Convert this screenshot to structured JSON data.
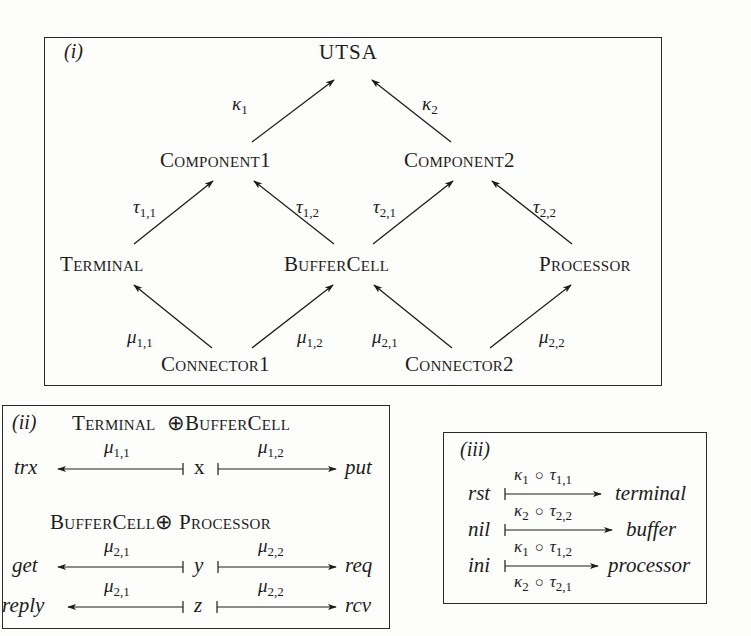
{
  "diagram_i": {
    "tag": "(i)",
    "nodes": {
      "root": "UTSA",
      "component1": "Component1",
      "component2": "Component2",
      "terminal": "Terminal",
      "buffercell": "BufferCell",
      "processor": "Processor",
      "connector1": "Connector1",
      "connector2": "Connector2"
    },
    "edges": {
      "kappa1": {
        "sym": "κ",
        "sub": "1",
        "from": "Component1",
        "to": "UTSA"
      },
      "kappa2": {
        "sym": "κ",
        "sub": "2",
        "from": "Component2",
        "to": "UTSA"
      },
      "tau11": {
        "sym": "τ",
        "sub": "1,1",
        "from": "Terminal",
        "to": "Component1"
      },
      "tau12": {
        "sym": "τ",
        "sub": "1,2",
        "from": "BufferCell",
        "to": "Component1"
      },
      "tau21": {
        "sym": "τ",
        "sub": "2,1",
        "from": "BufferCell",
        "to": "Component2"
      },
      "tau22": {
        "sym": "τ",
        "sub": "2,2",
        "from": "Processor",
        "to": "Component2"
      },
      "mu11": {
        "sym": "μ",
        "sub": "1,1",
        "from": "Connector1",
        "to": "Terminal"
      },
      "mu12": {
        "sym": "μ",
        "sub": "1,2",
        "from": "Connector1",
        "to": "BufferCell"
      },
      "mu21": {
        "sym": "μ",
        "sub": "2,1",
        "from": "Connector2",
        "to": "BufferCell"
      },
      "mu22": {
        "sym": "μ",
        "sub": "2,2",
        "from": "Connector2",
        "to": "Processor"
      }
    }
  },
  "diagram_ii": {
    "tag": "(ii)",
    "header1": {
      "left": "Terminal",
      "op": "⊕",
      "right": "BufferCell"
    },
    "header2": {
      "left": "BufferCell",
      "op": "⊕",
      "right": "Processor"
    },
    "rows": [
      {
        "left": "trx",
        "left_map": {
          "sym": "μ",
          "sub": "1,1"
        },
        "center": "x",
        "right_map": {
          "sym": "μ",
          "sub": "1,2"
        },
        "right": "put"
      },
      {
        "left": "get",
        "left_map": {
          "sym": "μ",
          "sub": "2,1"
        },
        "center": "y",
        "right_map": {
          "sym": "μ",
          "sub": "2,2"
        },
        "right": "req"
      },
      {
        "left": "reply",
        "left_map": {
          "sym": "μ",
          "sub": "2,1"
        },
        "center": "z",
        "right_map": {
          "sym": "μ",
          "sub": "2,2"
        },
        "right": "rcv"
      }
    ]
  },
  "diagram_iii": {
    "tag": "(iii)",
    "compose_op": "○",
    "rows": [
      {
        "source": "rst",
        "maps": [
          {
            "k": "κ",
            "ksub": "1",
            "t": "τ",
            "tsub": "1,1"
          }
        ],
        "target": "terminal"
      },
      {
        "source": "nil",
        "maps": [
          {
            "k": "κ",
            "ksub": "2",
            "t": "τ",
            "tsub": "2,2"
          }
        ],
        "target": "buffer"
      },
      {
        "source": "ini",
        "maps": [
          {
            "k": "κ",
            "ksub": "1",
            "t": "τ",
            "tsub": "1,2"
          },
          {
            "k": "κ",
            "ksub": "2",
            "t": "τ",
            "tsub": "2,1"
          }
        ],
        "target": "processor"
      }
    ]
  }
}
